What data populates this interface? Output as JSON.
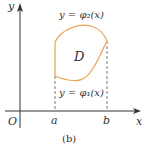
{
  "figure": {
    "caption": "(b)",
    "axis_x_label": "x",
    "axis_y_label": "y",
    "origin_label": "O",
    "point_a_label": "a",
    "point_b_label": "b",
    "region_label": "D",
    "upper_curve_label": "y = φ₂(x)",
    "lower_curve_label": "y = φ₁(x)"
  },
  "colors": {
    "axis": "#333333",
    "region_boundary": "#E8A85A",
    "dashed": "#555555",
    "text": "#333333"
  }
}
